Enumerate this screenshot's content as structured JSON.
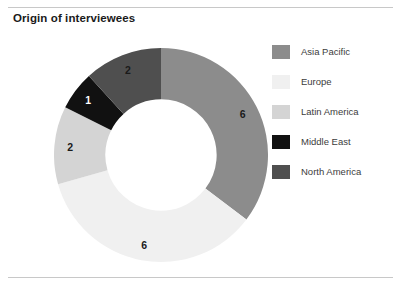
{
  "chart_title": "Origin of interviewees",
  "colors": {
    "asia_pacific": "#8c8c8c",
    "europe": "#f0f0f0",
    "latin_america": "#d4d4d4",
    "middle_east": "#111111",
    "north_america": "#4f4f4f",
    "rule": "#c8c8c8",
    "label_dark": "#1a1a1a",
    "label_light": "#ffffff",
    "background": "#ffffff"
  },
  "legend": {
    "position": "right",
    "items": [
      {
        "label": "Asia Pacific",
        "color": "#8c8c8c"
      },
      {
        "label": "Europe",
        "color": "#f0f0f0"
      },
      {
        "label": "Latin America",
        "color": "#d4d4d4"
      },
      {
        "label": "Middle East",
        "color": "#111111"
      },
      {
        "label": "North America",
        "color": "#4f4f4f"
      }
    ]
  },
  "chart_data": {
    "type": "pie",
    "variant": "donut",
    "title": "Origin of interviewees",
    "xlabel": "",
    "ylabel": "",
    "total": 17,
    "start_angle_deg": 0,
    "direction": "clockwise",
    "inner_radius_ratio": 0.52,
    "show_value_labels": true,
    "categories": [
      "Asia Pacific",
      "Europe",
      "Latin America",
      "Middle East",
      "North America"
    ],
    "values": [
      6,
      6,
      2,
      1,
      2
    ],
    "slices": [
      {
        "label": "Asia Pacific",
        "value": 6,
        "color": "#8c8c8c",
        "label_color": "#1a1a1a",
        "start_deg": 0,
        "end_deg": 127.06
      },
      {
        "label": "Europe",
        "value": 6,
        "color": "#f0f0f0",
        "label_color": "#1a1a1a",
        "start_deg": 127.06,
        "end_deg": 254.12
      },
      {
        "label": "Latin America",
        "value": 2,
        "color": "#d4d4d4",
        "label_color": "#1a1a1a",
        "start_deg": 254.12,
        "end_deg": 296.47
      },
      {
        "label": "Middle East",
        "value": 1,
        "color": "#111111",
        "label_color": "#ffffff",
        "start_deg": 296.47,
        "end_deg": 317.65
      },
      {
        "label": "North America",
        "value": 2,
        "color": "#4f4f4f",
        "label_color": "#1a1a1a",
        "start_deg": 317.65,
        "end_deg": 360
      }
    ],
    "legend": [
      "Asia Pacific",
      "Europe",
      "Latin America",
      "Middle East",
      "North America"
    ],
    "grid": false
  }
}
